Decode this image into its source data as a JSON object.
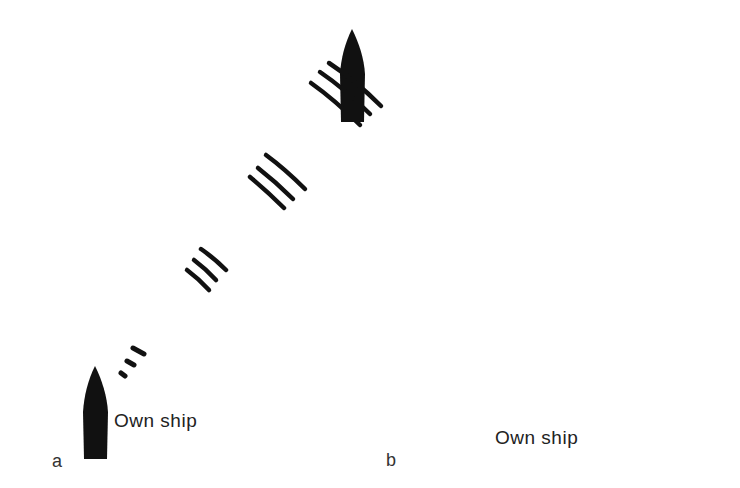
{
  "panels": [
    {
      "letter": "a",
      "own_ship_label": "Own ship",
      "description": "Pulse travelling from own ship toward target ship",
      "wave_style": "thick"
    },
    {
      "letter": "b",
      "own_ship_label": "Own ship",
      "description": "Echo returning from target ship to own ship",
      "wave_style": "thin"
    }
  ],
  "colors": {
    "ship": "#111111",
    "wave": "#111111",
    "background": "#ffffff"
  }
}
